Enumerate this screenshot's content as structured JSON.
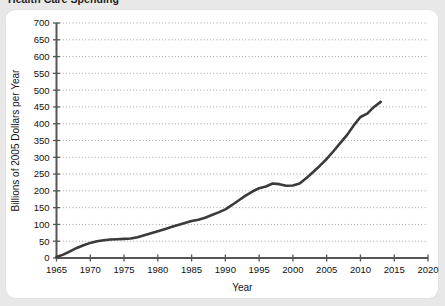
{
  "chart_title": "Health Care Spending",
  "colors": {
    "page_background": "#e8e8e8",
    "card_background": "#ffffff",
    "line": "#3a3a3a",
    "axis": "#555555",
    "gridline": "#9a9a9a",
    "text": "#111111"
  },
  "chart_data": {
    "type": "line",
    "title": "Health Care Spending",
    "xlabel": "Year",
    "ylabel": "Billions of 2005 Dollars per Year",
    "xlim": [
      1965,
      2020
    ],
    "ylim": [
      0,
      700
    ],
    "xticks": [
      1965,
      1970,
      1975,
      1980,
      1985,
      1990,
      1995,
      2000,
      2005,
      2010,
      2015,
      2020
    ],
    "yticks": [
      0,
      50,
      100,
      150,
      200,
      250,
      300,
      350,
      400,
      450,
      500,
      550,
      600,
      650,
      700
    ],
    "grid": "horizontal-dotted",
    "legend": "none",
    "series": [
      {
        "name": "Health Care Spending",
        "x": [
          1965,
          1966,
          1967,
          1968,
          1969,
          1970,
          1971,
          1972,
          1973,
          1974,
          1975,
          1976,
          1977,
          1978,
          1979,
          1980,
          1981,
          1982,
          1983,
          1984,
          1985,
          1986,
          1987,
          1988,
          1989,
          1990,
          1991,
          1992,
          1993,
          1994,
          1995,
          1996,
          1997,
          1998,
          1999,
          2000,
          2001,
          2002,
          2003,
          2004,
          2005,
          2006,
          2007,
          2008,
          2009,
          2010,
          2011,
          2012,
          2013
        ],
        "values": [
          3,
          10,
          20,
          30,
          38,
          45,
          50,
          53,
          55,
          56,
          57,
          58,
          62,
          68,
          74,
          80,
          86,
          92,
          98,
          104,
          110,
          114,
          120,
          128,
          136,
          145,
          158,
          172,
          186,
          198,
          208,
          213,
          222,
          220,
          215,
          216,
          222,
          238,
          256,
          275,
          295,
          318,
          342,
          366,
          395,
          420,
          430,
          450,
          465
        ]
      }
    ]
  },
  "axis": {
    "x_tick_labels": [
      "1965",
      "1970",
      "1975",
      "1980",
      "1985",
      "1990",
      "1995",
      "2000",
      "2005",
      "2010",
      "2015",
      "2020"
    ],
    "y_tick_labels": [
      "0",
      "50",
      "100",
      "150",
      "200",
      "250",
      "300",
      "350",
      "400",
      "450",
      "500",
      "550",
      "600",
      "650",
      "700"
    ],
    "x_title": "Year",
    "y_title": "Billions of 2005 Dollars per Year"
  }
}
